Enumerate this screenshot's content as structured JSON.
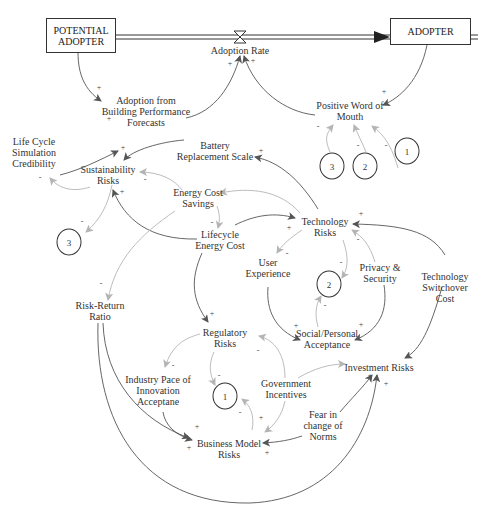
{
  "diagram": {
    "type": "causal-loop-diagram",
    "stocks": {
      "potential_adopter": "POTENTIAL\nADOPTER",
      "adopter": "ADOPTER"
    },
    "flow": {
      "adoption_rate": "Adoption Rate"
    },
    "variables": {
      "adoption_bpf": "Adoption from\nBuilding Performance\nForecasts",
      "positive_wom": "Positive Word of\nMouth",
      "lcs_credibility": "Life Cycle\nSimulation\nCredibility",
      "battery_scale": "Battery\nReplacement Scale",
      "sustainability_risks": "Sustainability\nRisks",
      "energy_cost_savings": "Energy Cost\nSavings",
      "lifecycle_energy_cost": "Lifecycle\nEnergy Cost",
      "technology_risks": "Technology\nRisks",
      "user_experience": "User\nExperience",
      "privacy_security": "Privacy &\nSecurity",
      "tech_switchover_cost": "Technology\nSwitchover Cost",
      "risk_return_ratio": "Risk-Return\nRatio",
      "regulatory_risks": "Regulatory\nRisks",
      "social_acceptance": "Social/Personal\nAcceptance",
      "industry_pace": "Industry Pace of\nInnovation\nAcceptane",
      "government_incentives": "Government\nIncentives",
      "investment_risks": "Investment Risks",
      "fear_norms": "Fear in\nchange of\nNorms",
      "business_model_risks": "Business Model\nRisks"
    },
    "loop_markers": {
      "top_3": "3",
      "top_2": "2",
      "top_1": "1",
      "left_3": "3",
      "mid_2": "2",
      "bottom_1": "1"
    },
    "polarities": [
      {
        "id": "p1",
        "sign": "+"
      },
      {
        "id": "p2",
        "sign": "+"
      },
      {
        "id": "p3",
        "sign": "+"
      },
      {
        "id": "p4",
        "sign": "+"
      },
      {
        "id": "p5",
        "sign": "+"
      },
      {
        "id": "p6",
        "sign": "-"
      },
      {
        "id": "p7",
        "sign": "-"
      },
      {
        "id": "p8",
        "sign": "-"
      },
      {
        "id": "p9",
        "sign": "+"
      },
      {
        "id": "p10",
        "sign": "-"
      },
      {
        "id": "p11",
        "sign": "-"
      },
      {
        "id": "p12",
        "sign": "+"
      },
      {
        "id": "p13",
        "sign": "-"
      },
      {
        "id": "p14",
        "sign": "-"
      },
      {
        "id": "p15",
        "sign": "+"
      },
      {
        "id": "p16",
        "sign": "+"
      },
      {
        "id": "p17",
        "sign": "-"
      },
      {
        "id": "p18",
        "sign": "-"
      },
      {
        "id": "p19",
        "sign": "-"
      },
      {
        "id": "p20",
        "sign": "+"
      },
      {
        "id": "p21",
        "sign": "-"
      },
      {
        "id": "p22",
        "sign": "-"
      },
      {
        "id": "p23",
        "sign": "+"
      },
      {
        "id": "p24",
        "sign": "+"
      },
      {
        "id": "p25",
        "sign": "+"
      },
      {
        "id": "p26",
        "sign": "-"
      },
      {
        "id": "p27",
        "sign": "-"
      },
      {
        "id": "p28",
        "sign": "-"
      },
      {
        "id": "p29",
        "sign": "-"
      },
      {
        "id": "p30",
        "sign": "-"
      },
      {
        "id": "p31",
        "sign": "+"
      },
      {
        "id": "p32",
        "sign": "+"
      },
      {
        "id": "p33",
        "sign": "+"
      },
      {
        "id": "p34",
        "sign": "+"
      },
      {
        "id": "p35",
        "sign": "+"
      },
      {
        "id": "p36",
        "sign": "+"
      }
    ],
    "colors": {
      "dark_link": "#555555",
      "light_link": "#b4b4b4",
      "text": "#333333"
    }
  }
}
